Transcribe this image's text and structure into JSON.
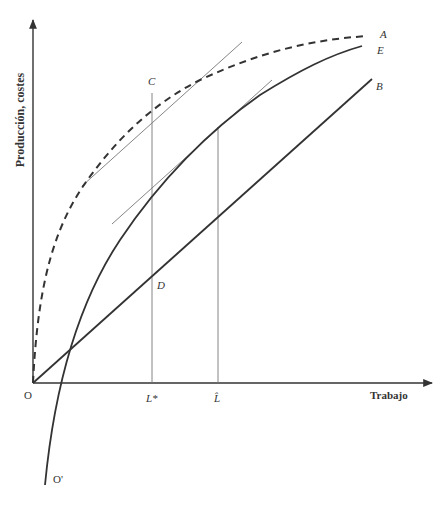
{
  "diagram": {
    "y_axis_label": "Producción, costes",
    "x_axis_label": "Trabajo",
    "origin_label": "O",
    "shifted_origin_label": "O'",
    "curves": [
      {
        "id": "A",
        "label": "A",
        "style": "dashed",
        "description": "curva de producción total desde O"
      },
      {
        "id": "E",
        "label": "E",
        "style": "solid",
        "description": "curva desde O' (producción neta)"
      },
      {
        "id": "B",
        "label": "B",
        "style": "solid",
        "description": "recta de costes desde O"
      }
    ],
    "points": [
      {
        "id": "C",
        "label": "C"
      },
      {
        "id": "D",
        "label": "D"
      }
    ],
    "x_ticks": [
      {
        "id": "L_star",
        "label": "L*"
      },
      {
        "id": "L_hat",
        "label": "L̂"
      }
    ],
    "colors": {
      "ink": "#333333",
      "thin_line": "#777777",
      "background": "#ffffff"
    }
  }
}
